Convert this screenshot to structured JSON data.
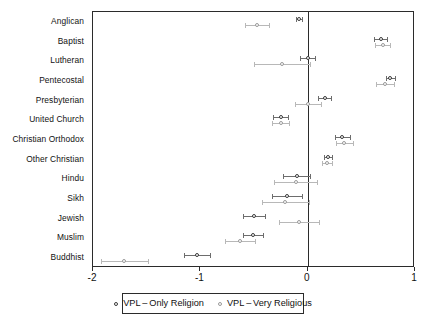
{
  "chart_data": {
    "type": "scatter",
    "title": "",
    "subtitle": "",
    "xlabel": "",
    "ylabel": "",
    "xlim": [
      -2,
      1
    ],
    "ylim_categories_top_to_bottom": true,
    "grid": false,
    "legend_position": "bottom",
    "xticks": [
      -2,
      -1,
      0,
      1
    ],
    "xtick_labels": [
      "-2",
      "-1",
      "0",
      "1"
    ],
    "reference_line_x": 0,
    "categories": [
      "Anglican",
      "Baptist",
      "Lutheran",
      "Pentecostal",
      "Presbyterian",
      "United Church",
      "Christian Orthodox",
      "Other Christian",
      "Hindu",
      "Sikh",
      "Jewish",
      "Muslim",
      "Buddhist"
    ],
    "series": [
      {
        "name": "VPL-Only Religion",
        "marker": "open-circle",
        "color": "#3a3a3a",
        "values": [
          -0.08,
          0.68,
          0.0,
          0.77,
          0.16,
          -0.25,
          0.32,
          0.19,
          -0.1,
          -0.19,
          -0.5,
          -0.51,
          -1.03
        ],
        "ci_low": [
          -0.11,
          0.62,
          -0.07,
          0.73,
          0.1,
          -0.32,
          0.25,
          0.15,
          -0.23,
          -0.33,
          -0.6,
          -0.6,
          -1.15
        ],
        "ci_high": [
          -0.05,
          0.74,
          0.07,
          0.81,
          0.22,
          -0.18,
          0.39,
          0.23,
          0.02,
          -0.05,
          -0.4,
          -0.42,
          -0.91
        ]
      },
      {
        "name": "VPL-Very Religious",
        "marker": "open-circle",
        "color": "#9a9a9a",
        "values": [
          -0.47,
          0.7,
          -0.24,
          0.72,
          0.0,
          -0.25,
          0.34,
          0.18,
          -0.11,
          -0.21,
          -0.08,
          -0.63,
          -1.71
        ],
        "ci_low": [
          -0.58,
          0.63,
          -0.5,
          0.64,
          -0.12,
          -0.33,
          0.26,
          0.13,
          -0.31,
          -0.43,
          -0.27,
          -0.77,
          -1.93
        ],
        "ci_high": [
          -0.36,
          0.77,
          0.02,
          0.8,
          0.12,
          -0.17,
          0.42,
          0.23,
          0.09,
          0.01,
          0.11,
          -0.49,
          -1.49
        ]
      }
    ]
  },
  "legend": {
    "items": [
      {
        "label": "VPL – Only Religion",
        "marker_class": "only"
      },
      {
        "label": "VPL – Very Religious",
        "marker_class": "very"
      }
    ]
  }
}
